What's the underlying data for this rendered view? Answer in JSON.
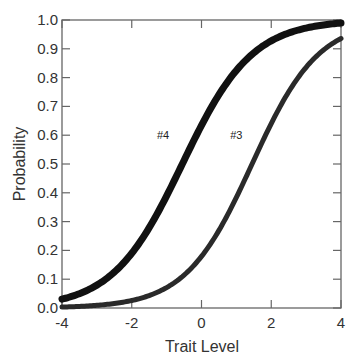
{
  "chart_data": {
    "type": "line",
    "title": "",
    "xlabel": "Trait Level",
    "ylabel": "Probability",
    "xlim": [
      -4,
      4
    ],
    "ylim": [
      0,
      1
    ],
    "grid": false,
    "x_ticks": [
      "-4",
      "-2",
      "0",
      "2",
      "4"
    ],
    "y_ticks": [
      "0.0",
      "0.1",
      "0.2",
      "0.3",
      "0.4",
      "0.5",
      "0.6",
      "0.7",
      "0.8",
      "0.9",
      "1.0"
    ],
    "series": [
      {
        "name": "#4",
        "model": "logistic",
        "discrimination": 1.0,
        "difficulty": -0.55,
        "x": [
          -4,
          -3,
          -2,
          -1,
          0,
          1,
          2,
          3,
          4
        ],
        "values": [
          0.03,
          0.08,
          0.19,
          0.39,
          0.63,
          0.82,
          0.93,
          0.97,
          0.99
        ],
        "line_width": "thick"
      },
      {
        "name": "#3",
        "model": "logistic",
        "discrimination": 1.05,
        "difficulty": 1.45,
        "x": [
          -4,
          -3,
          -2,
          -1,
          0,
          1,
          2,
          3,
          4
        ],
        "values": [
          0.003,
          0.01,
          0.03,
          0.07,
          0.18,
          0.38,
          0.64,
          0.84,
          0.94
        ],
        "line_width": "medium"
      }
    ],
    "annotations": [
      {
        "text": "#4",
        "x": -1.1,
        "y": 0.6
      },
      {
        "text": "#3",
        "x": 1.0,
        "y": 0.6
      }
    ]
  }
}
